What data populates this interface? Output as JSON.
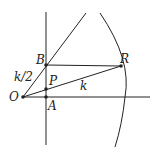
{
  "diagram": {
    "points": {
      "O": {
        "label": "O",
        "x": 23,
        "y": 97
      },
      "A": {
        "label": "A",
        "x": 46,
        "y": 97
      },
      "P": {
        "label": "P",
        "x": 46,
        "y": 89
      },
      "B": {
        "label": "B",
        "x": 46,
        "y": 65
      },
      "R": {
        "label": "R",
        "x": 121,
        "y": 66
      }
    },
    "segment_labels": {
      "OB": "k/2",
      "OR": "k"
    },
    "colors": {
      "stroke": "#222222",
      "background": "#ffffff"
    }
  }
}
